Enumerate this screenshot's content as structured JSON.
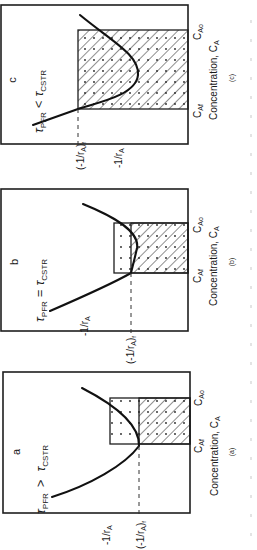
{
  "figure": {
    "orientation": "rotated 90 degrees clockwise (text reads bottom-to-top)",
    "x_axis_label": "Concentration, C",
    "x_axis_label_sub": "A",
    "y_axis_label": "-1/r",
    "y_axis_label_sub": "A",
    "y_final_label": "(-1/r",
    "y_final_label_sub": "A",
    "y_final_label_close": ")",
    "y_final_label_subsub": "f",
    "c_af": "C",
    "c_af_sub": "Af",
    "c_ao": "C",
    "c_ao_sub": "Ao",
    "panels": [
      {
        "id": "a",
        "letter": "a",
        "caption": "(a)",
        "tau_pfr": "τ",
        "tau_pfr_sub": "PFR",
        "relation": ">",
        "tau_cstr": "τ",
        "tau_cstr_sub": "CSTR",
        "description": "PFR area (under curve, dotted) greater than CSTR rectangle (hatched)"
      },
      {
        "id": "b",
        "letter": "b",
        "caption": "(b)",
        "tau_pfr": "τ",
        "tau_pfr_sub": "PFR",
        "relation": "=",
        "tau_cstr": "τ",
        "tau_cstr_sub": "CSTR",
        "description": "PFR area equals CSTR rectangle"
      },
      {
        "id": "c",
        "letter": "c",
        "caption": "(c)",
        "tau_pfr": "τ",
        "tau_pfr_sub": "PFR",
        "relation": "<",
        "tau_cstr": "τ",
        "tau_cstr_sub": "CSTR",
        "description": "PFR area smaller than CSTR rectangle"
      }
    ]
  }
}
